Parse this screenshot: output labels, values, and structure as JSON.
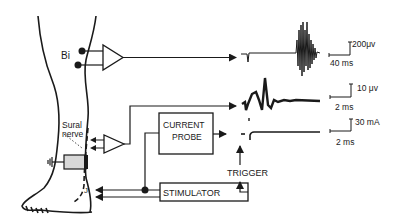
{
  "diagram": {
    "labels": {
      "bi": "Bi",
      "sural_line1": "Sural",
      "sural_line2": "nerve",
      "current_probe_line1": "CURRENT",
      "current_probe_line2": "PROBE",
      "stimulator": "STIMULATOR",
      "trigger": "TRIGGER",
      "j": "J"
    },
    "scale_bars": [
      {
        "vertical": "200μv",
        "horizontal": "40 ms"
      },
      {
        "vertical": "10 μv",
        "horizontal": "2 ms"
      },
      {
        "vertical": "30 mA",
        "horizontal": "2 ms"
      }
    ],
    "traces": [
      {
        "name": "biceps-femoris-emg",
        "description": "reflex EMG burst"
      },
      {
        "name": "sural-nerve-potential",
        "description": "averaged nerve action potential"
      },
      {
        "name": "stimulus-current",
        "description": "current probe pulse"
      }
    ],
    "colors": {
      "ink": "#1a1a1a",
      "cuff": "#d8d8d8",
      "background": "#ffffff"
    }
  }
}
